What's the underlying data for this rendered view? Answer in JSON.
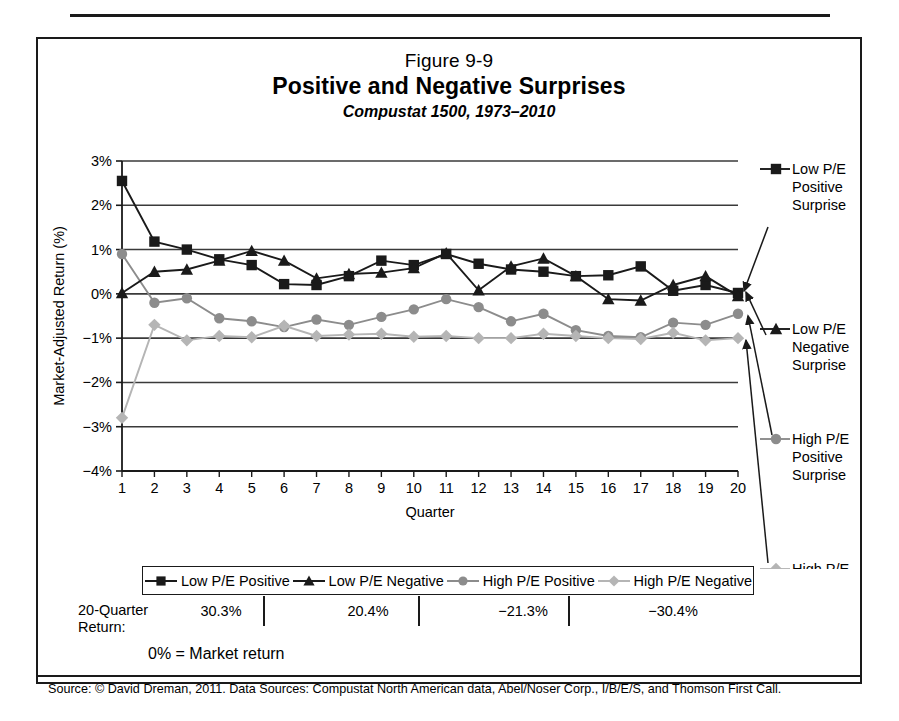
{
  "figure": {
    "top_rule": "",
    "title_number": "Figure 9-9",
    "title_main": "Positive and Negative Surprises",
    "title_sub": "Compustat 1500, 1973–2010",
    "market_note": "0% = Market return",
    "source": "Source: © David Dreman, 2011. Data Sources: Compustat North American data, Abel/Noser Corp., I/B/E/S, and Thomson First Call."
  },
  "returns_row": {
    "label": "20-Quarter Return:",
    "label_line1": "20-Quarter",
    "label_line2": "Return:",
    "values": [
      "30.3%",
      "20.4%",
      "−21.3%",
      "−30.4%"
    ]
  },
  "callouts": [
    {
      "name": "low-pe-positive",
      "line1": "Low P/E",
      "line2": "Positive",
      "line3": "Surprise",
      "marker": "square",
      "color": "#1a1a1a"
    },
    {
      "name": "low-pe-negative",
      "line1": "Low P/E",
      "line2": "Negative",
      "line3": "Surprise",
      "marker": "triangle",
      "color": "#1a1a1a"
    },
    {
      "name": "high-pe-positive",
      "line1": "High P/E",
      "line2": "Positive",
      "line3": "Surprise",
      "marker": "circle",
      "color": "#8c8c8c"
    },
    {
      "name": "high-pe-negative",
      "line1": "High P/E",
      "line2": "Negative",
      "line3": "Surprise",
      "marker": "diamond",
      "color": "#b5b5b5"
    }
  ],
  "chart_data": {
    "type": "line",
    "title": "Positive and Negative Surprises",
    "subtitle": "Compustat 1500, 1973–2010",
    "xlabel": "Quarter",
    "ylabel": "Market-Adjusted Return (%)",
    "x": [
      1,
      2,
      3,
      4,
      5,
      6,
      7,
      8,
      9,
      10,
      11,
      12,
      13,
      14,
      15,
      16,
      17,
      18,
      19,
      20
    ],
    "xtick_labels": [
      "1",
      "2",
      "3",
      "4",
      "5",
      "6",
      "7",
      "8",
      "9",
      "10",
      "11",
      "12",
      "13",
      "14",
      "15",
      "16",
      "17",
      "18",
      "19",
      "20"
    ],
    "ylim": [
      -4,
      3
    ],
    "yticks": [
      3,
      2,
      1,
      0,
      -1,
      -2,
      -3,
      -4
    ],
    "ytick_labels": [
      "3%",
      "2%",
      "1%",
      "0%",
      "−1%",
      "−2%",
      "−3%",
      "−4%"
    ],
    "grid": true,
    "legend_position": "below-axes",
    "series": [
      {
        "name": "Low P/E Positive",
        "marker": "square",
        "color": "#1a1a1a",
        "values": [
          2.55,
          1.18,
          1.0,
          0.78,
          0.65,
          0.22,
          0.2,
          0.4,
          0.75,
          0.65,
          0.9,
          0.68,
          0.55,
          0.5,
          0.4,
          0.42,
          0.62,
          0.07,
          0.2,
          0.02
        ]
      },
      {
        "name": "Low P/E Negative",
        "marker": "triangle",
        "color": "#1a1a1a",
        "values": [
          0.02,
          0.5,
          0.55,
          0.75,
          0.97,
          0.75,
          0.35,
          0.45,
          0.48,
          0.58,
          0.92,
          0.08,
          0.62,
          0.8,
          0.4,
          -0.12,
          -0.15,
          0.2,
          0.4,
          -0.05
        ]
      },
      {
        "name": "High P/E Positive",
        "marker": "circle",
        "color": "#8c8c8c",
        "values": [
          0.9,
          -0.2,
          -0.1,
          -0.55,
          -0.62,
          -0.75,
          -0.58,
          -0.7,
          -0.52,
          -0.35,
          -0.12,
          -0.3,
          -0.62,
          -0.45,
          -0.82,
          -0.95,
          -0.98,
          -0.65,
          -0.7,
          -0.45
        ]
      },
      {
        "name": "High P/E Negative",
        "marker": "diamond",
        "color": "#b5b5b5",
        "values": [
          -2.8,
          -0.7,
          -1.05,
          -0.95,
          -0.98,
          -0.72,
          -0.95,
          -0.92,
          -0.9,
          -0.97,
          -0.95,
          -1.0,
          -1.0,
          -0.9,
          -0.95,
          -1.0,
          -1.02,
          -0.88,
          -1.05,
          -1.0
        ]
      }
    ]
  }
}
